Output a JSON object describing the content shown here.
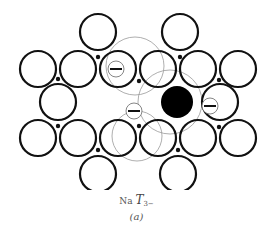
{
  "figure": {
    "caption": {
      "prefix": "Na",
      "symbol": "T",
      "subscript": "3−",
      "label": "(a)"
    },
    "colors": {
      "atom_stroke": "#111111",
      "guide_stroke": "#999999",
      "filled_atom": "#000000",
      "background": "#ffffff"
    },
    "atoms": [
      {
        "cx": 98,
        "cy": 32,
        "r": 18
      },
      {
        "cx": 180,
        "cy": 32,
        "r": 18
      },
      {
        "cx": 38,
        "cy": 69,
        "r": 18
      },
      {
        "cx": 78,
        "cy": 69,
        "r": 18
      },
      {
        "cx": 118,
        "cy": 69,
        "r": 18
      },
      {
        "cx": 158,
        "cy": 69,
        "r": 18
      },
      {
        "cx": 198,
        "cy": 69,
        "r": 18
      },
      {
        "cx": 238,
        "cy": 69,
        "r": 18
      },
      {
        "cx": 58,
        "cy": 102,
        "r": 18
      },
      {
        "cx": 220,
        "cy": 102,
        "r": 18
      },
      {
        "cx": 38,
        "cy": 138,
        "r": 18
      },
      {
        "cx": 78,
        "cy": 138,
        "r": 18
      },
      {
        "cx": 118,
        "cy": 138,
        "r": 18
      },
      {
        "cx": 158,
        "cy": 138,
        "r": 18
      },
      {
        "cx": 198,
        "cy": 138,
        "r": 18
      },
      {
        "cx": 238,
        "cy": 138,
        "r": 18
      },
      {
        "cx": 98,
        "cy": 174,
        "r": 18
      },
      {
        "cx": 178,
        "cy": 174,
        "r": 18
      }
    ],
    "filled_atom": {
      "cx": 177,
      "cy": 102,
      "r": 16
    },
    "guide_circles": [
      {
        "cx": 135,
        "cy": 66,
        "r": 29
      },
      {
        "cx": 170,
        "cy": 102,
        "r": 32
      },
      {
        "cx": 137,
        "cy": 136,
        "r": 25
      }
    ],
    "negative_ions": [
      {
        "cx": 116,
        "cy": 69,
        "r": 8,
        "sign": "−"
      },
      {
        "cx": 134,
        "cy": 111,
        "r": 8,
        "sign": "−"
      },
      {
        "cx": 210,
        "cy": 106,
        "r": 8,
        "sign": "−"
      }
    ],
    "small_dots": [
      {
        "cx": 98,
        "cy": 57
      },
      {
        "cx": 180,
        "cy": 57
      },
      {
        "cx": 58,
        "cy": 79
      },
      {
        "cx": 139,
        "cy": 81
      },
      {
        "cx": 219,
        "cy": 80
      },
      {
        "cx": 58,
        "cy": 126
      },
      {
        "cx": 139,
        "cy": 126
      },
      {
        "cx": 219,
        "cy": 127
      },
      {
        "cx": 98,
        "cy": 150
      },
      {
        "cx": 178,
        "cy": 150
      }
    ]
  }
}
